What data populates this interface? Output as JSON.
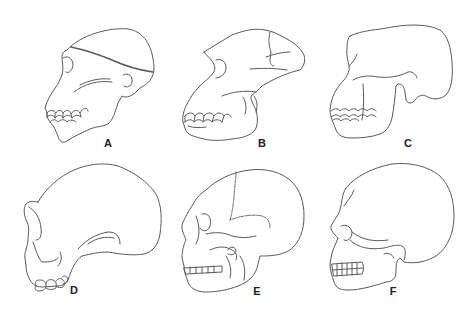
{
  "figure": {
    "background": "#ffffff",
    "line_color": "#5a5a5a",
    "panels": [
      {
        "id": "A",
        "label": "A",
        "subject": "skull-profile-a"
      },
      {
        "id": "B",
        "label": "B",
        "subject": "skull-profile-b"
      },
      {
        "id": "C",
        "label": "C",
        "subject": "skull-profile-c"
      },
      {
        "id": "D",
        "label": "D",
        "subject": "skull-profile-d"
      },
      {
        "id": "E",
        "label": "E",
        "subject": "skull-profile-e"
      },
      {
        "id": "F",
        "label": "F",
        "subject": "skull-profile-f"
      }
    ]
  }
}
